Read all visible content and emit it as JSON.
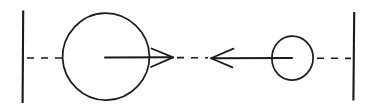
{
  "figure": {
    "background_color": "#ffffff",
    "ink_color": "#1a1a1a",
    "width": 378,
    "height": 112
  },
  "geometry": {
    "axis_y": 58,
    "walls": [
      {
        "name": "left-wall",
        "x": 23,
        "y_top": 10,
        "y_bottom": 103
      },
      {
        "name": "right-wall",
        "x": 354,
        "y_top": 12,
        "y_bottom": 101
      }
    ],
    "circles": [
      {
        "name": "large-circle",
        "cx": 105.5,
        "cy": 57,
        "rx": 43,
        "ry": 44,
        "rotation": -4
      },
      {
        "name": "small-circle",
        "cx": 292.5,
        "cy": 58,
        "rx": 20.5,
        "ry": 22,
        "rotation": -6
      }
    ],
    "arrows": [
      {
        "name": "right-arrow",
        "direction": "right",
        "shaft_x_start": 105,
        "shaft_x_end": 172,
        "tip_x": 173,
        "head_back_x": 151,
        "head_spread": 11
      },
      {
        "name": "left-arrow",
        "direction": "left",
        "shaft_x_start": 292,
        "shaft_x_end": 212,
        "tip_x": 211,
        "head_back_x": 233,
        "head_spread": 11
      }
    ],
    "dash_runs": [
      {
        "name": "left-dash-run",
        "x_start": 26,
        "x_end": 62
      },
      {
        "name": "center-dash-run",
        "x_start": 176,
        "x_end": 209
      },
      {
        "name": "right-dash-run",
        "x_start": 316,
        "x_end": 351
      }
    ],
    "dash_pattern": "7 7"
  },
  "labels": {
    "left_wall": "left-wall",
    "right_wall": "right-wall",
    "large_circle": "large-circle",
    "small_circle": "small-circle",
    "right_arrow": "right-arrow",
    "left_arrow": "left-arrow",
    "axis": "horizontal-dashed-axis"
  }
}
